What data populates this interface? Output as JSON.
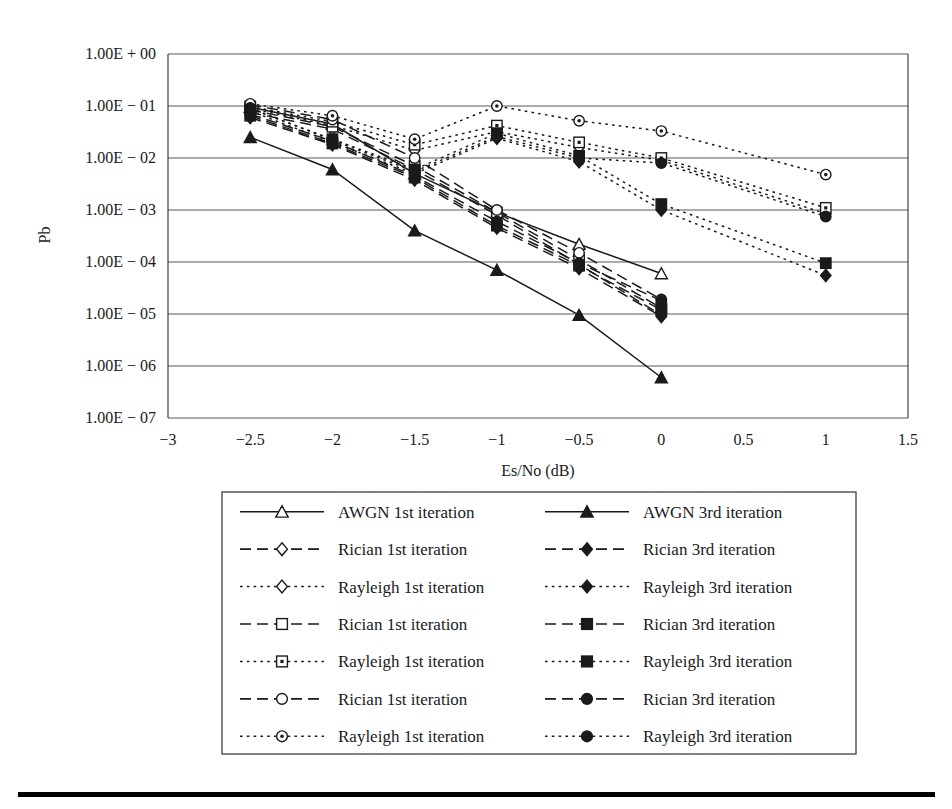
{
  "figure": {
    "ylabel": "Pb",
    "xlabel": "Es/No (dB)",
    "y_ticks": [
      "1.00E + 00",
      "1.00E − 01",
      "1.00E − 02",
      "1.00E − 03",
      "1.00E − 04",
      "1.00E − 05",
      "1.00E − 06",
      "1.00E − 07"
    ],
    "x_ticks": [
      "−3",
      "−2.5",
      "−2",
      "−1.5",
      "−1",
      "−0.5",
      "0",
      "0.5",
      "1",
      "1.5"
    ],
    "colors": {
      "ink": "#1a1a1a",
      "grid": "#585858",
      "axis": "#404040",
      "rule": "#000000"
    }
  },
  "legend": {
    "rows": [
      {
        "left": {
          "label": "AWGN 1st iteration",
          "marker": "triangle-open",
          "line": "solid"
        },
        "right": {
          "label": "AWGN 3rd iteration",
          "marker": "triangle-filled",
          "line": "solid"
        }
      },
      {
        "left": {
          "label": "Rician 1st iteration",
          "marker": "diamond-open",
          "line": "dashed"
        },
        "right": {
          "label": "Rician 3rd iteration",
          "marker": "diamond-filled",
          "line": "dashed"
        }
      },
      {
        "left": {
          "label": "Rayleigh 1st iteration",
          "marker": "diamond-open",
          "line": "dotted"
        },
        "right": {
          "label": "Rayleigh 3rd iteration",
          "marker": "diamond-filled",
          "line": "dotted"
        }
      },
      {
        "left": {
          "label": "Rician 1st iteration",
          "marker": "square-open",
          "line": "dashed"
        },
        "right": {
          "label": "Rician 3rd iteration",
          "marker": "square-filled",
          "line": "dashed"
        }
      },
      {
        "left": {
          "label": "Rayleigh 1st iteration",
          "marker": "square-dot",
          "line": "dotted"
        },
        "right": {
          "label": "Rayleigh 3rd iteration",
          "marker": "square-filled",
          "line": "dotted"
        }
      },
      {
        "left": {
          "label": "Rician 1st iteration",
          "marker": "circle-open",
          "line": "dashed"
        },
        "right": {
          "label": "Rician 3rd iteration",
          "marker": "circle-filled",
          "line": "dashed"
        }
      },
      {
        "left": {
          "label": "Rayleigh 1st iteration",
          "marker": "circle-dot",
          "line": "dotted"
        },
        "right": {
          "label": "Rayleigh 3rd iteration",
          "marker": "circle-filled",
          "line": "dotted"
        }
      }
    ]
  },
  "chart_data": {
    "type": "line",
    "title": "",
    "xlabel": "Es/No (dB)",
    "ylabel": "Pb",
    "xlim": [
      -3,
      1.5
    ],
    "ylim": [
      1e-07,
      1
    ],
    "yscale": "log",
    "grid": "horizontal",
    "legend_position": "below-plot",
    "x_ticks": [
      -3,
      -2.5,
      -2,
      -1.5,
      -1,
      -0.5,
      0,
      0.5,
      1,
      1.5
    ],
    "y_ticks": [
      1,
      0.1,
      0.01,
      0.001,
      0.0001,
      1e-05,
      1e-06,
      1e-07
    ],
    "series": [
      {
        "name": "AWGN 1st iteration",
        "marker": "triangle-open",
        "line": "solid",
        "x": [
          -2.5,
          -2,
          -1.5,
          -1,
          -0.5,
          0
        ],
        "y": [
          0.095,
          0.045,
          0.005,
          0.0009,
          0.00022,
          6e-05
        ]
      },
      {
        "name": "AWGN 3rd iteration",
        "marker": "triangle-filled",
        "line": "solid",
        "x": [
          -2.5,
          -2,
          -1.5,
          -1,
          -0.5,
          0
        ],
        "y": [
          0.025,
          0.006,
          0.0004,
          7e-05,
          9.5e-06,
          6e-07
        ]
      },
      {
        "name": "Rician 1st iteration (diamond)",
        "marker": "diamond-open",
        "line": "dashed",
        "x": [
          -2.5,
          -2,
          -1.5,
          -1,
          -0.5,
          0
        ],
        "y": [
          0.075,
          0.036,
          0.006,
          0.0008,
          9e-05,
          9.5e-06
        ]
      },
      {
        "name": "Rician 3rd iteration (diamond)",
        "marker": "diamond-filled",
        "line": "dashed",
        "x": [
          -2.5,
          -2,
          -1.5,
          -1,
          -0.5,
          0
        ],
        "y": [
          0.06,
          0.018,
          0.0038,
          0.00045,
          7.5e-05,
          9e-06
        ]
      },
      {
        "name": "Rayleigh 1st iteration (diamond)",
        "marker": "diamond-open",
        "line": "dotted",
        "x": [
          -2.5,
          -2,
          -1.5,
          -1,
          -0.5,
          0,
          1
        ],
        "y": [
          0.09,
          0.042,
          0.014,
          0.032,
          0.016,
          0.009,
          0.00085
        ]
      },
      {
        "name": "Rayleigh 3rd iteration (diamond)",
        "marker": "diamond-filled",
        "line": "dotted",
        "x": [
          -2.5,
          -2,
          -1.5,
          -1,
          -0.5,
          0,
          1
        ],
        "y": [
          0.08,
          0.02,
          0.005,
          0.024,
          0.0085,
          0.001,
          5.5e-05
        ]
      },
      {
        "name": "Rician 1st iteration (square)",
        "marker": "square-open",
        "line": "dashed",
        "x": [
          -2.5,
          -2,
          -1.5,
          -1,
          -0.5,
          0
        ],
        "y": [
          0.085,
          0.04,
          0.007,
          0.0009,
          0.00011,
          1.3e-05
        ]
      },
      {
        "name": "Rician 3rd iteration (square)",
        "marker": "square-filled",
        "line": "dashed",
        "x": [
          -2.5,
          -2,
          -1.5,
          -1,
          -0.5,
          0
        ],
        "y": [
          0.065,
          0.019,
          0.0042,
          0.0005,
          8.5e-05,
          1.2e-05
        ]
      },
      {
        "name": "Rayleigh 1st iteration (square)",
        "marker": "square-dot",
        "line": "dotted",
        "x": [
          -2.5,
          -2,
          -1.5,
          -1,
          -0.5,
          0,
          1
        ],
        "y": [
          0.098,
          0.05,
          0.018,
          0.042,
          0.02,
          0.01,
          0.0011
        ]
      },
      {
        "name": "Rayleigh 3rd iteration (square)",
        "marker": "square-filled",
        "line": "dotted",
        "x": [
          -2.5,
          -2,
          -1.5,
          -1,
          -0.5,
          0,
          1
        ],
        "y": [
          0.088,
          0.023,
          0.006,
          0.03,
          0.011,
          0.0013,
          9.5e-05
        ]
      },
      {
        "name": "Rician 1st iteration (circle)",
        "marker": "circle-open",
        "line": "dashed",
        "x": [
          -2.5,
          -2,
          -1.5,
          -1,
          -0.5,
          0
        ],
        "y": [
          0.105,
          0.055,
          0.01,
          0.001,
          0.00015,
          1.9e-05
        ]
      },
      {
        "name": "Rician 3rd iteration (circle)",
        "marker": "circle-filled",
        "line": "dashed",
        "x": [
          -2.5,
          -2,
          -1.5,
          -1,
          -0.5,
          0
        ],
        "y": [
          0.07,
          0.021,
          0.0045,
          0.0006,
          9.5e-05,
          1.8e-05
        ]
      },
      {
        "name": "Rayleigh 1st iteration (circle)",
        "marker": "circle-dot",
        "line": "dotted",
        "x": [
          -2.5,
          -2,
          -1.5,
          -1,
          -0.5,
          0,
          1
        ],
        "y": [
          0.11,
          0.065,
          0.023,
          0.1,
          0.052,
          0.033,
          0.0048
        ]
      },
      {
        "name": "Rayleigh 3rd iteration (circle)",
        "marker": "circle-filled",
        "line": "dotted",
        "x": [
          -2.5,
          -2,
          -1.5,
          -1,
          -0.5,
          0,
          1
        ],
        "y": [
          0.092,
          0.022,
          0.0055,
          0.026,
          0.01,
          0.008,
          0.00075
        ]
      }
    ]
  }
}
